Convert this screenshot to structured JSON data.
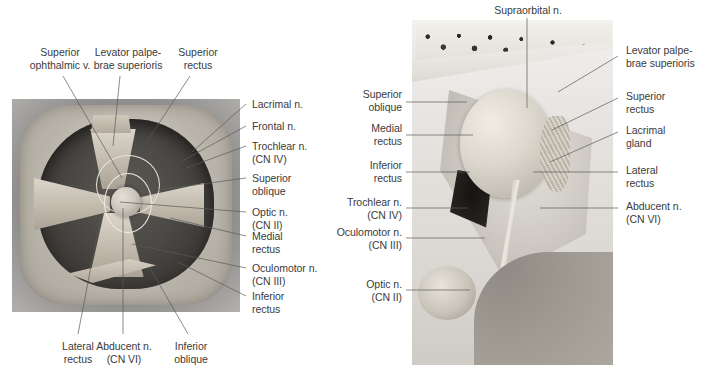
{
  "figure": {
    "panels": [
      {
        "id": "left-panel",
        "name": "anterior-view-of-orbit",
        "view": "Anterior view of the right orbit"
      },
      {
        "id": "right-panel",
        "name": "lateral-sagittal-view-of-orbit",
        "view": "Lateral (parasagittal) view of the right orbit"
      }
    ]
  },
  "colors": {
    "label_text": "#3b3b3b",
    "leader_line": "#5a5a5a",
    "background": "#ffffff"
  },
  "left_panel": {
    "labels_top": [
      {
        "id": "sup-ophthalmic-v",
        "text": "Superior\nophthalmic v.",
        "align": "center"
      },
      {
        "id": "levator-palpebrae",
        "text": "Levator palpe-\nbrae superioris",
        "align": "center"
      },
      {
        "id": "superior-rectus",
        "text": "Superior\nrectus",
        "align": "center"
      }
    ],
    "labels_right": [
      {
        "id": "lacrimal-n",
        "text": "Lacrimal n."
      },
      {
        "id": "frontal-n",
        "text": "Frontal n."
      },
      {
        "id": "trochlear-n",
        "text": "Trochlear n.\n(CN IV)"
      },
      {
        "id": "superior-oblique",
        "text": "Superior\noblique"
      },
      {
        "id": "optic-n",
        "text": "Optic n.\n(CN II)"
      },
      {
        "id": "medial-rectus",
        "text": "Medial\nrectus"
      },
      {
        "id": "oculomotor-n",
        "text": "Oculomotor n.\n(CN III)"
      },
      {
        "id": "inferior-rectus",
        "text": "Inferior\nrectus"
      }
    ],
    "labels_bottom": [
      {
        "id": "lateral-rectus",
        "text": "Lateral\nrectus",
        "align": "center"
      },
      {
        "id": "abducent-n",
        "text": "Abducent n.\n(CN VI)",
        "align": "center"
      },
      {
        "id": "inferior-oblique",
        "text": "Inferior\noblique",
        "align": "center"
      }
    ]
  },
  "right_panel": {
    "labels_top": [
      {
        "id": "supraorbital-n",
        "text": "Supraorbital n.",
        "align": "center"
      }
    ],
    "labels_left": [
      {
        "id": "superior-oblique",
        "text": "Superior\noblique"
      },
      {
        "id": "medial-rectus",
        "text": "Medial\nrectus"
      },
      {
        "id": "inferior-rectus",
        "text": "Inferior\nrectus"
      },
      {
        "id": "trochlear-n",
        "text": "Trochlear n.\n(CN IV)"
      },
      {
        "id": "oculomotor-n",
        "text": "Oculomotor n.\n(CN III)"
      },
      {
        "id": "optic-n",
        "text": "Optic n.\n(CN II)"
      }
    ],
    "labels_right": [
      {
        "id": "levator-palpebrae",
        "text": "Levator palpe-\nbrae superioris"
      },
      {
        "id": "superior-rectus",
        "text": "Superior\nrectus"
      },
      {
        "id": "lacrimal-gland",
        "text": "Lacrimal\ngland"
      },
      {
        "id": "lateral-rectus",
        "text": "Lateral\nrectus"
      },
      {
        "id": "abducent-n",
        "text": "Abducent n.\n(CN VI)"
      }
    ]
  }
}
